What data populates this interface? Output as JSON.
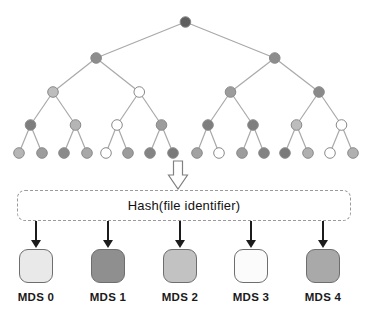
{
  "diagram": {
    "background": "#ffffff",
    "hash_box": {
      "label": "Hash(file identifier)",
      "border_color": "#9a9a9a",
      "text_color": "#111111"
    },
    "tree": {
      "edge_color": "#a9a9a9",
      "node_outline": "#8a8a8a",
      "levels": [
        {
          "name": "root",
          "fills": [
            "#5f5f5f"
          ]
        },
        {
          "name": "level-2",
          "fills": [
            "#8d8d8d",
            "#8d8d8d"
          ]
        },
        {
          "name": "level-3",
          "fills": [
            "#bdbdbd",
            "#ffffff",
            "#9c9c9c",
            "#8a8a8a"
          ]
        },
        {
          "name": "level-4",
          "fills": [
            "#7e7e7e",
            "#b5b5b5",
            "#ffffff",
            "#9c9c9c",
            "#7e7e7e",
            "#7e7e7e",
            "#bdbdbd",
            "#ffffff"
          ]
        },
        {
          "name": "leaves",
          "fills": [
            "#b5b5b5",
            "#9c9c9c",
            "#8a8a8a",
            "#a8a8a8",
            "#ffffff",
            "#9c9c9c",
            "#848484",
            "#7a7a7a",
            "#a2a2a2",
            "#ffffff",
            "#9c9c9c",
            "#828282",
            "#7a7a7a",
            "#b0b0b0",
            "#ffffff",
            "#b0b0b0"
          ]
        }
      ]
    },
    "arrow_color": "#1c1c1c",
    "mds_nodes": [
      {
        "label": "MDS 0",
        "fill": "#e9e9e9"
      },
      {
        "label": "MDS 1",
        "fill": "#8f8f8f"
      },
      {
        "label": "MDS 2",
        "fill": "#c2c2c2"
      },
      {
        "label": "MDS 3",
        "fill": "#fbfbfb"
      },
      {
        "label": "MDS 4",
        "fill": "#a9a9a9"
      }
    ]
  }
}
